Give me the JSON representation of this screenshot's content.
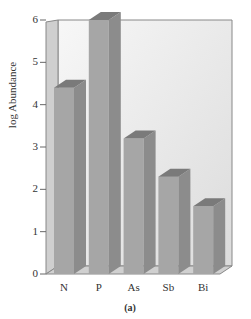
{
  "chart_data": {
    "type": "bar",
    "style": "3d",
    "title": "",
    "caption": "(a)",
    "xlabel": "",
    "ylabel": "log Abundance",
    "categories": [
      "N",
      "P",
      "As",
      "Sb",
      "Bi"
    ],
    "values": [
      4.4,
      6.0,
      3.2,
      2.3,
      1.6
    ],
    "yticks": [
      "0",
      "1",
      "2",
      "3",
      "4",
      "5",
      "6"
    ],
    "ylim": [
      0,
      6
    ],
    "grid": false,
    "legend": null,
    "colors": {
      "bar_front": "#a6a6a6",
      "bar_side": "#8c8c8c",
      "bar_top": "#7a7a7a",
      "wall": "#e8e8e8",
      "floor": "#d0d0d0"
    }
  }
}
